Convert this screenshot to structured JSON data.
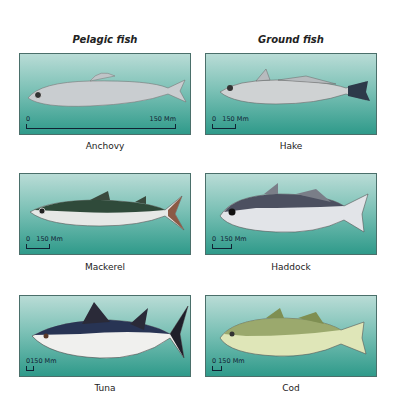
{
  "columns": [
    {
      "title": "Pelagic fish"
    },
    {
      "title": "Ground fish"
    }
  ],
  "fish": [
    {
      "name": "Anchovy",
      "scale_start": "0",
      "scale_end": "150 Mm",
      "scale_bar_px": 150
    },
    {
      "name": "Hake",
      "scale_start": "0",
      "scale_end": "150 Mm",
      "scale_bar_px": 22
    },
    {
      "name": "Mackerel",
      "scale_start": "0",
      "scale_end": "150 Mm",
      "scale_bar_px": 22
    },
    {
      "name": "Haddock",
      "scale_start": "0",
      "scale_end": "150 Mm",
      "scale_bar_px": 18
    },
    {
      "name": "Tuna",
      "scale_start": "0",
      "scale_end": "150 Mm",
      "scale_bar_px": 6
    },
    {
      "name": "Cod",
      "scale_start": "0",
      "scale_end": "150 Mm",
      "scale_bar_px": 8
    }
  ],
  "colors": {
    "water_top": "#b9dcd6",
    "water_bottom": "#2f9a8a",
    "border": "#4a6f6a"
  }
}
